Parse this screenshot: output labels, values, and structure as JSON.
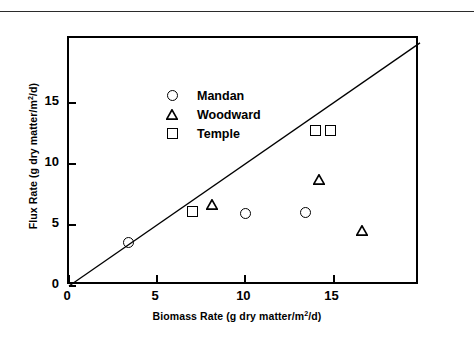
{
  "figure": {
    "background_color": "#ffffff",
    "ink_color": "#000000"
  },
  "chart_data": {
    "type": "scatter",
    "title": "",
    "xlabel": "Biomass Rate (g dry matter/m2/d)",
    "ylabel": "Flux Rate (g dry matter/m2/d)",
    "xlabel_parts": {
      "pre": "Biomass Rate (g dry matter/m",
      "sup": "2",
      "post": "/d)"
    },
    "ylabel_parts": {
      "pre": "Flux Rate (g dry matter/m",
      "sup": "2",
      "post": "/d)"
    },
    "xlim": [
      0,
      19.9
    ],
    "ylim": [
      0,
      20.3
    ],
    "xticks": [
      0,
      5,
      10,
      15
    ],
    "yticks": [
      0,
      5,
      10,
      15
    ],
    "xticklabels": [
      "0",
      "5",
      "10",
      "15"
    ],
    "yticklabels": [
      "0",
      "5",
      "10",
      "15"
    ],
    "grid": false,
    "legend_position": "upper left",
    "reference_line": {
      "name": "one-to-one-line",
      "slope": 1,
      "intercept": 0,
      "style": "solid",
      "color": "#000000"
    },
    "series": [
      {
        "name": "Mandan",
        "marker": "circle",
        "color": "#000000",
        "filled": false,
        "points": [
          {
            "x": 3.4,
            "y": 3.6
          },
          {
            "x": 10.0,
            "y": 5.9
          },
          {
            "x": 13.4,
            "y": 6.0
          }
        ]
      },
      {
        "name": "Woodward",
        "marker": "triangle",
        "color": "#000000",
        "filled": false,
        "points": [
          {
            "x": 8.1,
            "y": 6.6
          },
          {
            "x": 14.2,
            "y": 8.7
          },
          {
            "x": 16.6,
            "y": 4.5
          }
        ]
      },
      {
        "name": "Temple",
        "marker": "square",
        "color": "#000000",
        "filled": false,
        "points": [
          {
            "x": 7.0,
            "y": 6.1
          },
          {
            "x": 14.0,
            "y": 12.7
          },
          {
            "x": 14.8,
            "y": 12.7
          }
        ]
      }
    ],
    "legend": [
      {
        "label": "Mandan",
        "marker": "circle"
      },
      {
        "label": "Woodward",
        "marker": "triangle"
      },
      {
        "label": "Temple",
        "marker": "square"
      }
    ]
  }
}
